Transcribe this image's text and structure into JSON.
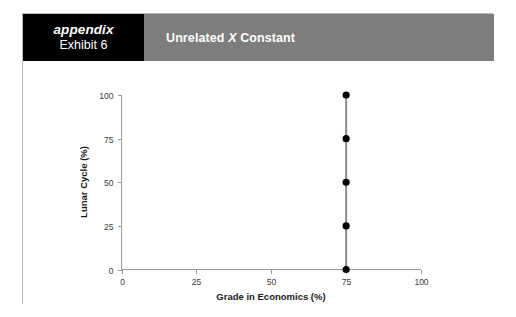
{
  "card": {
    "header": {
      "appendix_label": "appendix",
      "exhibit_label": "Exhibit 6",
      "title_prefix": "Unrelated ",
      "title_variable": "X",
      "title_suffix": " Constant",
      "black_block_color": "#000000",
      "band_color": "#7d7d7d",
      "text_color": "#ffffff"
    }
  },
  "chart_data": {
    "type": "scatter",
    "title": "Unrelated X Constant",
    "xlabel": "Grade in Economics (%)",
    "ylabel": "Lunar Cycle (%)",
    "xlim": [
      0,
      100
    ],
    "ylim": [
      0,
      100
    ],
    "xticks": [
      0,
      25,
      50,
      75,
      100
    ],
    "yticks": [
      0,
      25,
      50,
      75,
      100
    ],
    "xtick_labels": [
      "0",
      "25",
      "50",
      "75",
      "100"
    ],
    "ytick_labels": [
      "0",
      "25",
      "50",
      "75",
      "100"
    ],
    "grid": false,
    "legend": "none",
    "series": [
      {
        "name": "Lunar Cycle vs Grade",
        "x": [
          75,
          75,
          75,
          75,
          75
        ],
        "y": [
          0,
          25,
          50,
          75,
          100
        ],
        "point_color": "#000000",
        "line_color": "#8c8c8c",
        "connected": true
      }
    ]
  }
}
